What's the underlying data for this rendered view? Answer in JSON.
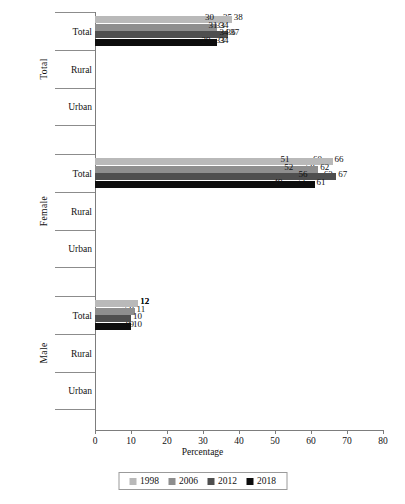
{
  "chart_data": {
    "type": "bar",
    "orientation": "horizontal",
    "title": "",
    "xlabel": "Percentage",
    "ylabel": "",
    "xlim": [
      0,
      80
    ],
    "xticks": [
      0,
      10,
      20,
      30,
      40,
      50,
      60,
      70,
      80
    ],
    "grid": false,
    "legend_position": "bottom",
    "series": [
      {
        "name": "1998",
        "color": "#b9b9b9"
      },
      {
        "name": "2006",
        "color": "#8e8e8e"
      },
      {
        "name": "2012",
        "color": "#4f4f4f"
      },
      {
        "name": "2018",
        "color": "#0d0d0d"
      }
    ],
    "panels": [
      {
        "label": "Total",
        "rows": [
          {
            "label": "Total",
            "values": [
              35,
              33,
              36,
              33
            ]
          },
          {
            "label": "Rural",
            "values": [
              38,
              34,
              37,
              34
            ]
          },
          {
            "label": "Urban",
            "values": [
              30,
              31,
              34,
              29
            ]
          }
        ]
      },
      {
        "label": "Female",
        "rows": [
          {
            "label": "Total",
            "values": [
              60,
              58,
              63,
              56
            ]
          },
          {
            "label": "Rural",
            "values": [
              66,
              62,
              67,
              61
            ]
          },
          {
            "label": "Urban",
            "values": [
              51,
              52,
              56,
              49
            ]
          }
        ]
      },
      {
        "label": "Male",
        "rows": [
          {
            "label": "Total",
            "values": [
              12,
              9,
              7,
              9
            ]
          },
          {
            "label": "Rural",
            "values": [
              12,
              7,
              5,
              8
            ]
          },
          {
            "label": "Urban",
            "values": [
              12,
              11,
              10,
              10
            ]
          }
        ]
      }
    ]
  }
}
